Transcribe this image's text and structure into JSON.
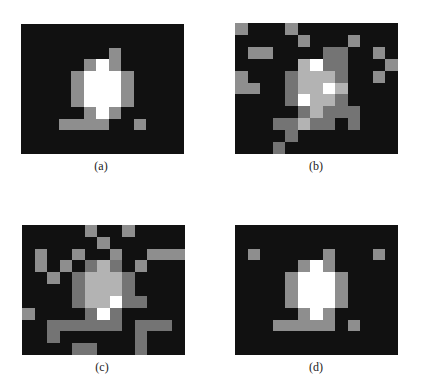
{
  "figure": {
    "grid": {
      "rows": 11,
      "cols": 13
    },
    "palette": {
      "0": "#111111",
      "1": "#8e8e8e",
      "2": "#747474",
      "3": "#b3b3b3",
      "4": "#ffffff"
    },
    "panels": [
      {
        "id": "a",
        "caption": "(a)",
        "box": {
          "x": 21,
          "y": 24,
          "w": 163,
          "h": 130
        },
        "caption_pos": {
          "x": 101,
          "y": 160
        },
        "cells": [
          [
            0,
            0,
            0,
            0,
            0,
            0,
            0,
            0,
            0,
            0,
            0,
            0,
            0
          ],
          [
            0,
            0,
            0,
            0,
            0,
            0,
            0,
            0,
            0,
            0,
            0,
            0,
            0
          ],
          [
            0,
            0,
            0,
            0,
            0,
            0,
            0,
            1,
            0,
            0,
            0,
            0,
            0
          ],
          [
            0,
            0,
            0,
            0,
            0,
            1,
            4,
            1,
            0,
            0,
            0,
            0,
            0
          ],
          [
            0,
            0,
            0,
            0,
            1,
            4,
            4,
            4,
            1,
            0,
            0,
            0,
            0
          ],
          [
            0,
            0,
            0,
            0,
            1,
            4,
            4,
            4,
            1,
            0,
            0,
            0,
            0
          ],
          [
            0,
            0,
            0,
            0,
            1,
            4,
            4,
            4,
            1,
            0,
            0,
            0,
            0
          ],
          [
            0,
            0,
            0,
            0,
            0,
            1,
            4,
            1,
            0,
            0,
            0,
            0,
            0
          ],
          [
            0,
            0,
            0,
            1,
            1,
            1,
            1,
            0,
            0,
            1,
            0,
            0,
            0
          ],
          [
            0,
            0,
            0,
            0,
            0,
            0,
            0,
            0,
            0,
            0,
            0,
            0,
            0
          ],
          [
            0,
            0,
            0,
            0,
            0,
            0,
            0,
            0,
            0,
            0,
            0,
            0,
            0
          ]
        ]
      },
      {
        "id": "b",
        "caption": "(b)",
        "box": {
          "x": 235,
          "y": 23,
          "w": 163,
          "h": 131
        },
        "caption_pos": {
          "x": 316,
          "y": 160
        },
        "cells": [
          [
            1,
            0,
            0,
            0,
            1,
            0,
            0,
            0,
            0,
            0,
            0,
            0,
            0
          ],
          [
            0,
            0,
            0,
            0,
            0,
            1,
            0,
            0,
            0,
            1,
            0,
            0,
            0
          ],
          [
            0,
            1,
            1,
            0,
            0,
            0,
            0,
            2,
            2,
            0,
            0,
            1,
            0
          ],
          [
            0,
            0,
            0,
            0,
            0,
            3,
            4,
            2,
            2,
            0,
            0,
            0,
            1
          ],
          [
            1,
            0,
            0,
            0,
            2,
            3,
            3,
            3,
            2,
            0,
            0,
            1,
            0
          ],
          [
            1,
            1,
            0,
            0,
            2,
            3,
            3,
            4,
            3,
            0,
            0,
            0,
            0
          ],
          [
            0,
            0,
            0,
            0,
            2,
            4,
            3,
            3,
            2,
            0,
            0,
            0,
            0
          ],
          [
            0,
            0,
            0,
            0,
            0,
            2,
            3,
            2,
            2,
            2,
            0,
            0,
            0
          ],
          [
            0,
            0,
            0,
            2,
            2,
            3,
            2,
            2,
            0,
            2,
            0,
            0,
            0
          ],
          [
            0,
            0,
            0,
            0,
            2,
            0,
            0,
            0,
            0,
            0,
            0,
            0,
            0
          ],
          [
            0,
            0,
            0,
            2,
            0,
            0,
            0,
            0,
            0,
            0,
            0,
            0,
            0
          ]
        ]
      },
      {
        "id": "c",
        "caption": "(c)",
        "box": {
          "x": 22,
          "y": 225,
          "w": 163,
          "h": 130
        },
        "caption_pos": {
          "x": 102,
          "y": 361
        },
        "cells": [
          [
            0,
            0,
            0,
            0,
            0,
            1,
            0,
            0,
            1,
            0,
            0,
            0,
            0
          ],
          [
            0,
            0,
            0,
            0,
            0,
            0,
            1,
            0,
            0,
            0,
            0,
            0,
            0
          ],
          [
            0,
            1,
            0,
            0,
            1,
            0,
            0,
            1,
            0,
            0,
            1,
            1,
            1
          ],
          [
            0,
            1,
            0,
            1,
            0,
            2,
            3,
            2,
            0,
            1,
            0,
            0,
            0
          ],
          [
            0,
            0,
            1,
            0,
            2,
            3,
            3,
            3,
            2,
            0,
            0,
            0,
            0
          ],
          [
            0,
            0,
            0,
            0,
            2,
            3,
            3,
            3,
            2,
            0,
            0,
            0,
            0
          ],
          [
            0,
            0,
            0,
            0,
            2,
            3,
            3,
            4,
            2,
            2,
            0,
            0,
            0
          ],
          [
            1,
            0,
            0,
            0,
            0,
            2,
            4,
            2,
            0,
            0,
            0,
            0,
            0
          ],
          [
            0,
            0,
            2,
            2,
            2,
            2,
            2,
            2,
            0,
            2,
            2,
            2,
            0
          ],
          [
            0,
            0,
            2,
            0,
            0,
            0,
            0,
            0,
            0,
            2,
            0,
            0,
            0
          ],
          [
            0,
            0,
            0,
            0,
            2,
            2,
            0,
            0,
            0,
            2,
            0,
            0,
            0
          ]
        ]
      },
      {
        "id": "d",
        "caption": "(d)",
        "box": {
          "x": 235,
          "y": 225,
          "w": 163,
          "h": 130
        },
        "caption_pos": {
          "x": 316,
          "y": 361
        },
        "cells": [
          [
            0,
            0,
            0,
            0,
            0,
            0,
            0,
            0,
            0,
            0,
            0,
            0,
            0
          ],
          [
            0,
            0,
            0,
            0,
            0,
            0,
            0,
            0,
            0,
            0,
            0,
            0,
            0
          ],
          [
            0,
            1,
            0,
            0,
            0,
            0,
            0,
            1,
            0,
            0,
            0,
            1,
            0
          ],
          [
            0,
            0,
            0,
            0,
            0,
            1,
            4,
            1,
            0,
            0,
            0,
            0,
            0
          ],
          [
            0,
            0,
            0,
            0,
            1,
            4,
            4,
            4,
            1,
            0,
            0,
            0,
            0
          ],
          [
            0,
            0,
            0,
            0,
            1,
            4,
            4,
            4,
            1,
            0,
            0,
            0,
            0
          ],
          [
            0,
            0,
            0,
            0,
            1,
            4,
            4,
            4,
            1,
            0,
            0,
            0,
            0
          ],
          [
            0,
            0,
            0,
            0,
            0,
            1,
            4,
            1,
            0,
            0,
            0,
            0,
            0
          ],
          [
            0,
            0,
            0,
            1,
            1,
            1,
            1,
            1,
            0,
            1,
            0,
            0,
            0
          ],
          [
            0,
            0,
            0,
            0,
            0,
            0,
            0,
            0,
            0,
            0,
            0,
            0,
            0
          ],
          [
            0,
            0,
            0,
            0,
            0,
            0,
            0,
            0,
            0,
            0,
            0,
            0,
            0
          ]
        ]
      }
    ]
  }
}
